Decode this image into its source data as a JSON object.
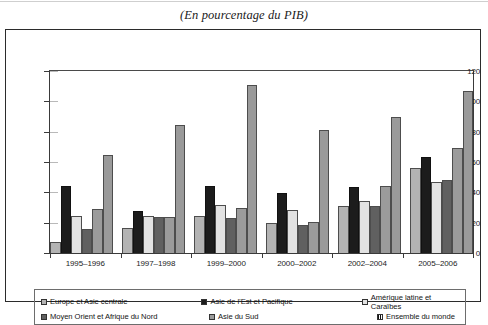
{
  "subtitle": "(En pourcentage du PIB)",
  "chart_data": {
    "type": "bar",
    "title": "",
    "subtitle": "(En pourcentage du PIB)",
    "xlabel": "",
    "ylabel": "",
    "ylim": [
      0,
      120
    ],
    "yticks": [
      0,
      20,
      40,
      60,
      80,
      100,
      120
    ],
    "grid": false,
    "legend_position": "bottom",
    "categories": [
      "1995–1996",
      "1997–1998",
      "1999–2000",
      "2000–2002",
      "2002–2004",
      "2005–2006"
    ],
    "series": [
      {
        "name": "Europe et Asie centrale",
        "color": "#b3b3b3",
        "values": [
          7,
          16.5,
          24.5,
          20,
          31,
          56
        ]
      },
      {
        "name": "Asie de l’Est et Pacifique",
        "color": "#1c1c1c",
        "values": [
          44.5,
          28,
          44.5,
          39.5,
          43.5,
          63
        ]
      },
      {
        "name": "Amérique latine et Caraïbes",
        "color": "#e2e2e2",
        "values": [
          24.5,
          24.5,
          31.5,
          28.5,
          34,
          47
        ]
      },
      {
        "name": "Moyen Orient et Afrique du Nord",
        "color": "#606060",
        "values": [
          16,
          24,
          23,
          18.5,
          31,
          48
        ]
      },
      {
        "name": "Asie du Sud",
        "color": "#9b9b9b",
        "values": [
          29,
          23.5,
          30,
          20.5,
          44,
          69
        ]
      },
      {
        "name": "Ensemble du monde",
        "color": "#9a9a9a",
        "values": [
          64.5,
          84.5,
          110.5,
          81,
          90,
          106.5
        ]
      }
    ]
  },
  "legend": {
    "items": [
      {
        "label": "Europe et Asie centrale",
        "swatch": "legend-swatch-europe"
      },
      {
        "label": "Asie de l’Est et Pacifique",
        "swatch": "legend-swatch-east-asia"
      },
      {
        "label": "Amérique latine et Caraïbes",
        "swatch": "legend-swatch-latin-america"
      },
      {
        "label": "Moyen Orient et Afrique du Nord",
        "swatch": "legend-swatch-mena"
      },
      {
        "label": "Asie du Sud",
        "swatch": "legend-swatch-south-asia"
      },
      {
        "label": "Ensemble du monde",
        "swatch": "legend-swatch-world"
      }
    ]
  }
}
